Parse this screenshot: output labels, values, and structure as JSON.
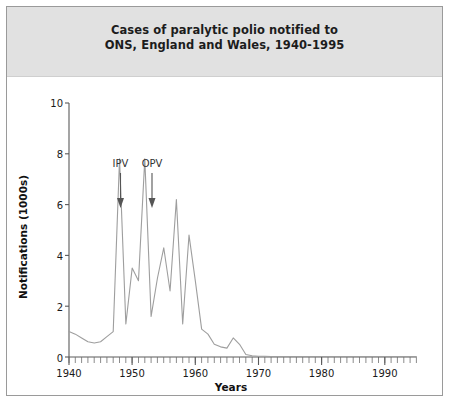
{
  "figure": {
    "title_line1": "Cases of paralytic polio notified to",
    "title_line2": "ONS, England and Wales, 1940-1995",
    "border_color": "#9a9a9a",
    "header_background": "#e1e1e1",
    "plot_background": "#ffffff",
    "line_color": "#9e9e9e"
  },
  "chart_data": {
    "type": "line",
    "title": "Cases of paralytic polio notified to ONS, England and Wales, 1940-1995",
    "xlabel": "Years",
    "ylabel": "Notifications (1000s)",
    "xlim": [
      1940,
      1995
    ],
    "ylim": [
      0,
      10
    ],
    "xticks": [
      1940,
      1950,
      1960,
      1970,
      1980,
      1990
    ],
    "xtick_labels": [
      "1940",
      "1950",
      "1960",
      "1970",
      "1980",
      "1990"
    ],
    "yticks": [
      0,
      2,
      4,
      6,
      8,
      10
    ],
    "ytick_labels": [
      "0",
      "2",
      "4",
      "6",
      "8",
      "10"
    ],
    "minor_xtick_interval": 1,
    "grid": false,
    "legend": null,
    "series": [
      {
        "name": "Paralytic polio notifications (1000s)",
        "x": [
          1940,
          1941,
          1942,
          1943,
          1944,
          1945,
          1946,
          1947,
          1948,
          1949,
          1950,
          1951,
          1952,
          1953,
          1954,
          1955,
          1956,
          1957,
          1958,
          1959,
          1960,
          1961,
          1962,
          1963,
          1964,
          1965,
          1966,
          1967,
          1968,
          1969,
          1970,
          1971,
          1972,
          1973,
          1974,
          1975,
          1976,
          1977,
          1978,
          1979,
          1980,
          1981,
          1982,
          1983,
          1984,
          1985,
          1986,
          1987,
          1988,
          1989,
          1990,
          1991,
          1992,
          1993,
          1994,
          1995
        ],
        "values": [
          1.0,
          0.9,
          0.75,
          0.6,
          0.55,
          0.6,
          0.8,
          1.0,
          7.8,
          1.3,
          3.5,
          3.0,
          7.8,
          1.6,
          3.1,
          4.3,
          2.6,
          6.2,
          1.3,
          4.8,
          3.0,
          1.1,
          0.9,
          0.5,
          0.4,
          0.35,
          0.75,
          0.5,
          0.1,
          0.05,
          0.03,
          0.03,
          0.02,
          0.02,
          0.02,
          0.02,
          0.02,
          0.02,
          0.02,
          0.02,
          0.02,
          0.02,
          0.02,
          0.02,
          0.02,
          0.02,
          0.02,
          0.02,
          0.02,
          0.02,
          0.02,
          0.02,
          0.02,
          0.02,
          0.02,
          0.02
        ]
      }
    ],
    "annotations": [
      {
        "label": "IPV",
        "x": 1956,
        "description": "inactivated polio vaccine introduced",
        "arrow": "down"
      },
      {
        "label": "OPV",
        "x": 1962,
        "description": "oral polio vaccine introduced",
        "arrow": "down"
      }
    ]
  }
}
